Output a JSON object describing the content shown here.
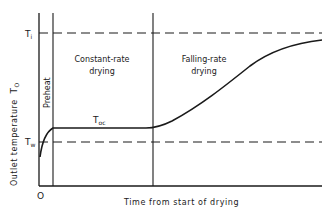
{
  "diagram": {
    "y_axis_label": "Outlet temperature",
    "y_axis_symbol": "T",
    "y_axis_symbol_sub": "O",
    "x_axis_label": "Time from start of drying",
    "origin_label": "O",
    "levels": {
      "inlet": {
        "symbol": "T",
        "sub": "i"
      },
      "wet_bulb": {
        "symbol": "T",
        "sub": "w"
      },
      "constant_outlet": {
        "symbol": "T",
        "sub": "oc"
      }
    },
    "regions": {
      "preheat": "Preheat",
      "constant_line1": "Constant-rate",
      "constant_line2": "drying",
      "falling_line1": "Falling-rate",
      "falling_line2": "drying"
    },
    "colors": {
      "line": "#1a1a1a",
      "background": "#ffffff"
    }
  }
}
